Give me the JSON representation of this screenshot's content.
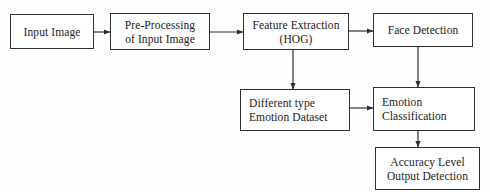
{
  "diagram": {
    "background": "#fefefe",
    "stroke": "#303030",
    "text_color": "#1a1a1a",
    "nodes": [
      {
        "id": "input-image",
        "lines": [
          "Input Image"
        ],
        "x": 10,
        "y": 14,
        "w": 84,
        "h": 35,
        "align": "center"
      },
      {
        "id": "pre-processing",
        "lines": [
          "Pre-Processing",
          "of Input Image"
        ],
        "x": 110,
        "y": 13,
        "w": 100,
        "h": 37,
        "align": "center"
      },
      {
        "id": "feature-extraction",
        "lines": [
          "Feature Extraction",
          "(HOG)"
        ],
        "x": 243,
        "y": 13,
        "w": 106,
        "h": 37,
        "align": "center"
      },
      {
        "id": "face-detection",
        "lines": [
          "Face Detection"
        ],
        "x": 373,
        "y": 13,
        "w": 100,
        "h": 34,
        "align": "center"
      },
      {
        "id": "emotion-dataset",
        "lines": [
          "Different type",
          "Emotion Dataset"
        ],
        "x": 240,
        "y": 89,
        "w": 110,
        "h": 42,
        "align": "left"
      },
      {
        "id": "emotion-classification",
        "lines": [
          "Emotion",
          "Classification"
        ],
        "x": 373,
        "y": 87,
        "w": 102,
        "h": 44,
        "align": "left"
      },
      {
        "id": "accuracy-output",
        "lines": [
          "Accuracy Level",
          "Output Detection"
        ],
        "x": 375,
        "y": 147,
        "w": 105,
        "h": 43,
        "align": "center"
      }
    ],
    "connectors": [
      {
        "id": "input-to-preprocessing",
        "from": "input-image",
        "to": "pre-processing",
        "orientation": "horizontal",
        "x1": 94,
        "y1": 32,
        "x2": 110,
        "y2": 32
      },
      {
        "id": "preprocessing-to-feature",
        "from": "pre-processing",
        "to": "feature-extraction",
        "orientation": "horizontal",
        "x1": 210,
        "y1": 32,
        "x2": 243,
        "y2": 32
      },
      {
        "id": "feature-to-face",
        "from": "feature-extraction",
        "to": "face-detection",
        "orientation": "horizontal",
        "x1": 349,
        "y1": 31,
        "x2": 373,
        "y2": 31
      },
      {
        "id": "feature-to-dataset",
        "from": "feature-extraction",
        "to": "emotion-dataset",
        "orientation": "vertical",
        "x1": 293,
        "y1": 50,
        "x2": 293,
        "y2": 89
      },
      {
        "id": "face-to-classification",
        "from": "face-detection",
        "to": "emotion-classification",
        "orientation": "vertical",
        "x1": 418,
        "y1": 47,
        "x2": 418,
        "y2": 87
      },
      {
        "id": "dataset-to-classification",
        "from": "emotion-dataset",
        "to": "emotion-classification",
        "orientation": "horizontal",
        "x1": 350,
        "y1": 108,
        "x2": 373,
        "y2": 108
      },
      {
        "id": "classification-to-accuracy",
        "from": "emotion-classification",
        "to": "accuracy-output",
        "orientation": "vertical",
        "x1": 418,
        "y1": 131,
        "x2": 418,
        "y2": 147
      }
    ]
  }
}
